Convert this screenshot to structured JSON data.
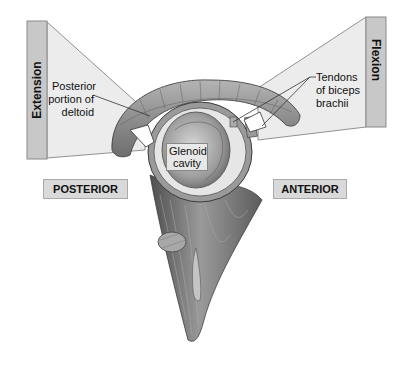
{
  "diagram": {
    "motion_labels": {
      "left": "Extension",
      "right": "Flexion"
    },
    "direction_labels": {
      "posterior": "POSTERIOR",
      "anterior": "ANTERIOR"
    },
    "structure_labels": {
      "deltoid": [
        "Posterior",
        "portion of",
        "deltoid"
      ],
      "biceps": [
        "Tendons",
        "of biceps",
        "brachii"
      ],
      "glenoid": [
        "Glenoid",
        "cavity"
      ]
    },
    "colors": {
      "bar_fill": "#c8c8c8",
      "bar_border": "#8a8a8a",
      "fan_fill": "#ececec",
      "label_box_fill": "#d9d9d9",
      "muscle_dark": "#5a5a5a",
      "muscle_mid": "#8c8c8c",
      "muscle_light": "#bdbdbd"
    }
  }
}
